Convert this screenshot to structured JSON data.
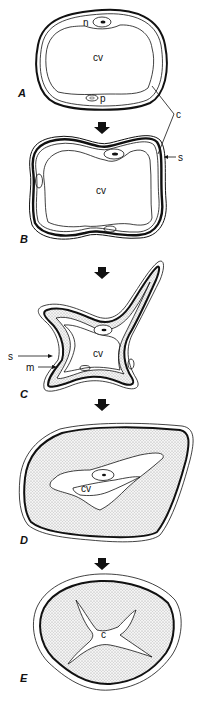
{
  "figure": {
    "panels": [
      {
        "id": "A",
        "label": "A",
        "labels": {
          "nucleus": "n",
          "vacuole": "cv",
          "plastid": "p",
          "cell_wall": "c"
        }
      },
      {
        "id": "B",
        "label": "B",
        "labels": {
          "vacuole": "cv",
          "secondary_wall": "s"
        }
      },
      {
        "id": "C",
        "label": "C",
        "labels": {
          "vacuole": "cv",
          "secondary_wall": "s",
          "middle_layer": "m"
        }
      },
      {
        "id": "D",
        "label": "D",
        "labels": {
          "vacuole": "cv"
        }
      },
      {
        "id": "E",
        "label": "E",
        "labels": {
          "lumen": "c"
        }
      }
    ],
    "arrows": [
      "arrow-down",
      "arrow-down",
      "arrow-down",
      "arrow-down"
    ],
    "colors": {
      "stroke": "#111111",
      "stipple": "#c8c8c8",
      "background": "#ffffff"
    }
  }
}
